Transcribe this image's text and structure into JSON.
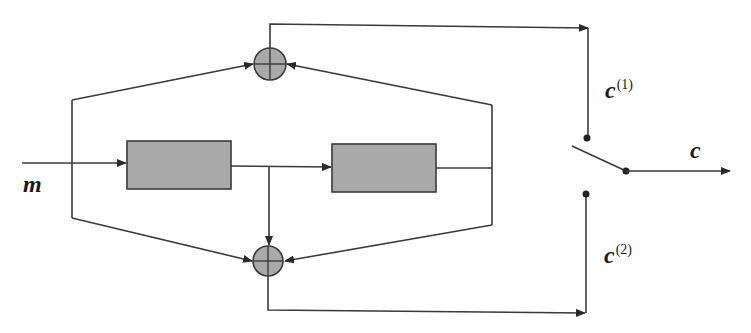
{
  "diagram": {
    "title": "",
    "colors": {
      "wire": "#3a3a3a",
      "block_fill": "#a9a9a9",
      "adder_fill": "#a9a9a9",
      "background": "#ffffff"
    },
    "labels": {
      "input": "m",
      "output": "c",
      "branch1_base": "c",
      "branch1_sup": "(1)",
      "branch2_base": "c",
      "branch2_sup": "(2)"
    },
    "blocks": [
      {
        "id": "block-1",
        "label": ""
      },
      {
        "id": "block-2",
        "label": ""
      }
    ],
    "adders": [
      {
        "id": "adder-top",
        "symbol": "plus"
      },
      {
        "id": "adder-bottom",
        "symbol": "plus"
      }
    ],
    "switch": {
      "contacts": [
        "c(1)",
        "c(2)"
      ],
      "output": "c"
    }
  }
}
